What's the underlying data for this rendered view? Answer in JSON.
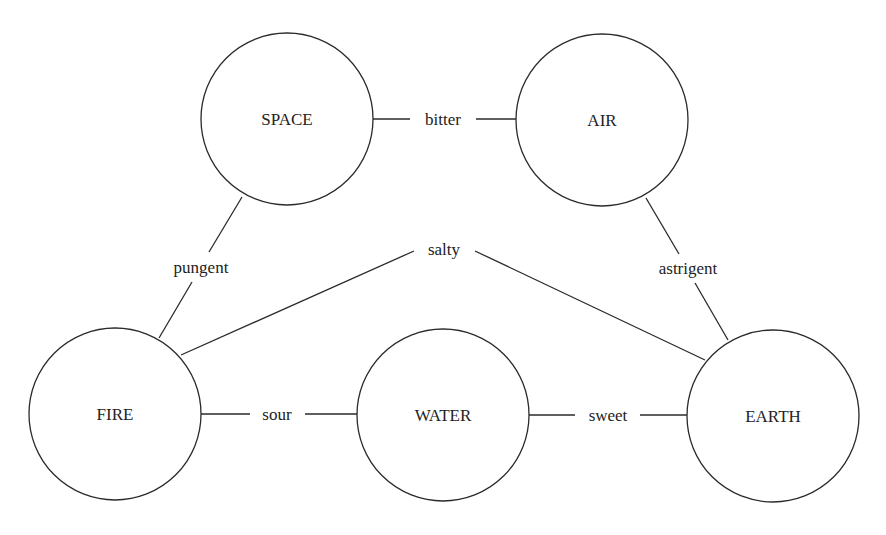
{
  "diagram": {
    "nodes": [
      {
        "id": "space",
        "label": "SPACE",
        "cx": 287,
        "cy": 119,
        "r": 86
      },
      {
        "id": "air",
        "label": "AIR",
        "cx": 602,
        "cy": 120,
        "r": 86
      },
      {
        "id": "fire",
        "label": "FIRE",
        "cx": 115,
        "cy": 414,
        "r": 86
      },
      {
        "id": "water",
        "label": "WATER",
        "cx": 443,
        "cy": 415,
        "r": 86
      },
      {
        "id": "earth",
        "label": "EARTH",
        "cx": 773,
        "cy": 416,
        "r": 86
      }
    ],
    "edges": [
      {
        "from": "SPACE",
        "to": "AIR",
        "label": "bitter"
      },
      {
        "from": "SPACE",
        "to": "FIRE",
        "label": "pungent"
      },
      {
        "from": "FIRE",
        "to": "EARTH",
        "label": "salty"
      },
      {
        "from": "AIR",
        "to": "EARTH",
        "label": "astrigent"
      },
      {
        "from": "FIRE",
        "to": "WATER",
        "label": "sour"
      },
      {
        "from": "WATER",
        "to": "EARTH",
        "label": "sweet"
      }
    ]
  }
}
